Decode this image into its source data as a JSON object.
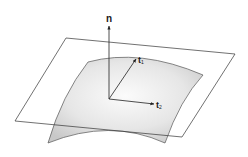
{
  "diagram": {
    "labels": {
      "normal": "n",
      "tangent1_base": "t",
      "tangent1_sub": "1",
      "tangent2_base": "t",
      "tangent2_sub": "2"
    },
    "colors": {
      "stroke": "#333333",
      "surface_fill_light": "#f7f7f7",
      "surface_fill_dark": "#cfcfcf",
      "background": "#ffffff"
    }
  }
}
